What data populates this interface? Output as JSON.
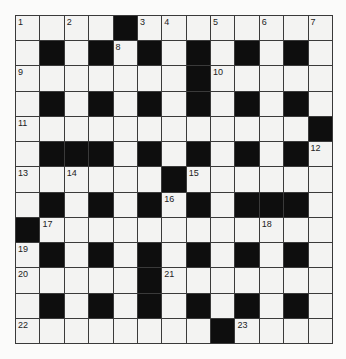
{
  "puzzle": {
    "rows": 13,
    "cols": 13,
    "colors": {
      "white_cell": "#f3f3f2",
      "black_cell": "#0e0e0e",
      "grid_line": "#3a3a3a",
      "number": "#222222"
    },
    "grid": [
      [
        "1",
        "",
        "2",
        "",
        "#",
        "3",
        "4",
        "",
        "5",
        "",
        "6",
        "",
        "7"
      ],
      [
        "",
        "#",
        "",
        "#",
        "8",
        "#",
        "",
        "#",
        "",
        "#",
        "",
        "#",
        ""
      ],
      [
        "9",
        "",
        "",
        "",
        "",
        "",
        "",
        "#",
        "10",
        "",
        "",
        "",
        ""
      ],
      [
        "",
        "#",
        "",
        "#",
        "",
        "#",
        "",
        "#",
        "",
        "#",
        "",
        "#",
        ""
      ],
      [
        "11",
        "",
        "",
        "",
        "",
        "",
        "",
        "",
        "",
        "",
        "",
        "",
        "#"
      ],
      [
        "",
        "#",
        "#",
        "#",
        "",
        "#",
        "",
        "#",
        "",
        "#",
        "",
        "#",
        "12"
      ],
      [
        "13",
        "",
        "14",
        "",
        "",
        "",
        "#",
        "15",
        "",
        "",
        "",
        "",
        ""
      ],
      [
        "",
        "#",
        "",
        "#",
        "",
        "#",
        "16",
        "#",
        "",
        "#",
        "#",
        "#",
        ""
      ],
      [
        "#",
        "17",
        "",
        "",
        "",
        "",
        "",
        "",
        "",
        "",
        "18",
        "",
        ""
      ],
      [
        "19",
        "#",
        "",
        "#",
        "",
        "#",
        "",
        "#",
        "",
        "#",
        "",
        "#",
        ""
      ],
      [
        "20",
        "",
        "",
        "",
        "",
        "#",
        "21",
        "",
        "",
        "",
        "",
        "",
        ""
      ],
      [
        "",
        "#",
        "",
        "#",
        "",
        "#",
        "",
        "#",
        "",
        "#",
        "",
        "#",
        ""
      ],
      [
        "22",
        "",
        "",
        "",
        "",
        "",
        "",
        "",
        "#",
        "23",
        "",
        "",
        ""
      ]
    ]
  }
}
